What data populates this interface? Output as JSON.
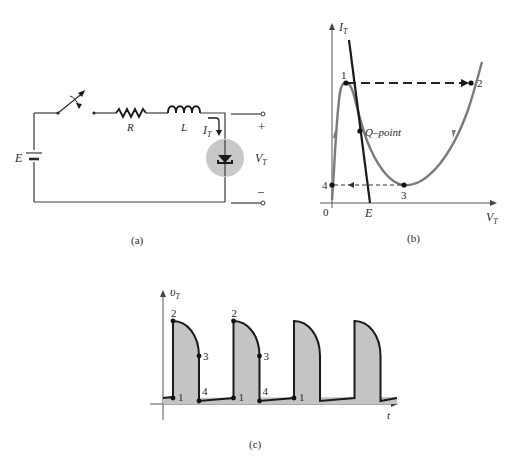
{
  "figure_a": {
    "caption": "(a)",
    "source_label": "E",
    "resistor_label": "R",
    "inductor_label": "L",
    "current_label_main": "I",
    "current_label_sub": "T",
    "voltage_label_main": "V",
    "voltage_label_sub": "T",
    "plus_sign": "+",
    "minus_sign": "−",
    "components": [
      "battery",
      "switch",
      "resistor",
      "inductor",
      "tunnel-diode"
    ],
    "colors": {
      "diode_highlight": "#c8c8c8"
    }
  },
  "figure_b": {
    "caption": "(b)",
    "y_axis_main": "I",
    "y_axis_sub": "T",
    "x_axis_main": "V",
    "x_axis_sub": "T",
    "origin_label": "0",
    "e_label": "E",
    "qpoint_label": "Q–point",
    "points": [
      {
        "id": "1",
        "label": "1"
      },
      {
        "id": "2",
        "label": "2"
      },
      {
        "id": "3",
        "label": "3"
      },
      {
        "id": "4",
        "label": "4"
      }
    ],
    "colors": {
      "curve": "#7a7a7a",
      "load_line": "#1a1a1a"
    }
  },
  "figure_c": {
    "caption": "(c)",
    "y_axis_main": "υ",
    "y_axis_sub": "T",
    "x_axis_label": "t",
    "pulse_count": 4,
    "annotated_pulses": [
      {
        "labels": [
          "1",
          "2",
          "3",
          "4"
        ]
      },
      {
        "labels": [
          "1",
          "2",
          "3",
          "4"
        ]
      },
      {
        "labels": [
          "1"
        ]
      }
    ],
    "colors": {
      "pulse_fill": "#c4c4c4",
      "outline": "#1a1a1a"
    }
  }
}
